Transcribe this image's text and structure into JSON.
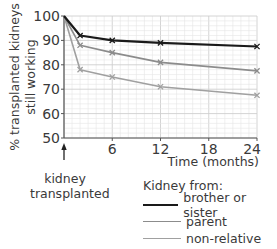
{
  "chart_data": {
    "type": "line",
    "title": "",
    "xlabel": "Time (months)",
    "ylabel": "% transplanted kidneys still working",
    "ylabel_lines": [
      "% transplanted kidneys",
      "still working"
    ],
    "xlim": [
      0,
      24
    ],
    "ylim": [
      50,
      100
    ],
    "xticks": [
      6,
      12,
      18,
      24
    ],
    "yticks": [
      50,
      60,
      70,
      80,
      90,
      100
    ],
    "grid": true,
    "x": [
      0,
      2,
      6,
      12,
      24
    ],
    "series": [
      {
        "name": "brother or sister",
        "color": "#1a1a1a",
        "width": 2.2,
        "values": [
          100,
          92,
          90,
          89,
          87.5
        ]
      },
      {
        "name": "parent",
        "color": "#8c8c8c",
        "width": 1.6,
        "values": [
          100,
          88,
          85,
          81,
          77.5
        ]
      },
      {
        "name": "non-relative",
        "color": "#a0a0a0",
        "width": 1.6,
        "values": [
          100,
          78,
          75,
          71,
          67.5
        ]
      }
    ],
    "legend": {
      "title": "Kidney from:",
      "position": "bottom-right"
    },
    "annotations": [
      {
        "x": 0,
        "text": "kidney transplanted",
        "arrow": "up"
      }
    ]
  },
  "annotation": {
    "line1": "kidney",
    "line2": "transplanted"
  },
  "legend": {
    "title": "Kidney from:",
    "items": [
      {
        "label": "brother or sister"
      },
      {
        "label": "parent"
      },
      {
        "label": "non-relative"
      }
    ]
  },
  "colors": {
    "grid_minor": "#e6e6e6",
    "grid_major": "#cfcfcf",
    "axis": "#555555"
  }
}
